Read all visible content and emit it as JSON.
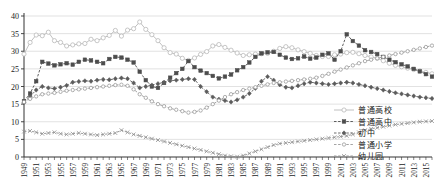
{
  "chart_data": {
    "type": "line",
    "title": "",
    "subtitle": "",
    "xlabel": "",
    "ylabel": "",
    "xlim": [
      1949,
      2016
    ],
    "ylim": [
      0,
      40
    ],
    "yticks": [
      0,
      5,
      10,
      15,
      20,
      25,
      30,
      35,
      40
    ],
    "ytick_labels": [
      "0",
      "5",
      "10",
      "15",
      "20",
      "25",
      "30",
      "35",
      "40"
    ],
    "grid": true,
    "grid_axis": "y",
    "legend_position": "bottom-right",
    "xtick_labels": [
      "1949",
      "1951",
      "1953",
      "1955",
      "1957",
      "1959",
      "1961",
      "1963",
      "1965",
      "1967",
      "1969",
      "1971",
      "1973",
      "1975",
      "1977",
      "1979",
      "1981",
      "1983",
      "1985",
      "1987",
      "1989",
      "1991",
      "1993",
      "1995",
      "1997",
      "1999",
      "2001",
      "2003",
      "2005",
      "2007",
      "2009",
      "2011",
      "2013",
      "2015"
    ],
    "x": [
      1949,
      1950,
      1951,
      1952,
      1953,
      1954,
      1955,
      1956,
      1957,
      1958,
      1959,
      1960,
      1961,
      1962,
      1963,
      1964,
      1965,
      1966,
      1967,
      1968,
      1969,
      1970,
      1971,
      1972,
      1973,
      1974,
      1975,
      1976,
      1977,
      1978,
      1979,
      1980,
      1981,
      1982,
      1983,
      1984,
      1985,
      1986,
      1987,
      1988,
      1989,
      1990,
      1991,
      1992,
      1993,
      1994,
      1995,
      1996,
      1997,
      1998,
      1999,
      2000,
      2001,
      2002,
      2003,
      2004,
      2005,
      2006,
      2007,
      2008,
      2009,
      2010,
      2011,
      2012,
      2013,
      2014,
      2015,
      2016
    ],
    "series": [
      {
        "name": "普通高校",
        "marker": "circle-open",
        "linestyle": "solid",
        "color": "#b9b9b9",
        "values": [
          29.2,
          32.5,
          34.6,
          34.4,
          35.4,
          33.0,
          32.5,
          31.5,
          31.8,
          32.1,
          32.2,
          33.4,
          33.0,
          33.8,
          34.5,
          35.9,
          34.3,
          36.0,
          36.4,
          38.3,
          36.2,
          34.7,
          33.0,
          31.0,
          29.6,
          29.2,
          28.0,
          27.4,
          28.1,
          29.1,
          29.9,
          31.5,
          31.9,
          31.1,
          30.3,
          29.5,
          28.8,
          29.0,
          29.2,
          29.3,
          29.4,
          30.0,
          30.8,
          31.3,
          31.0,
          30.4,
          29.9,
          29.4,
          28.8,
          28.5,
          28.5,
          29.0,
          29.2,
          29.6,
          29.7,
          29.3,
          28.8,
          28.4,
          28.0,
          27.3,
          26.6,
          26.0,
          25.6,
          25.2,
          24.8,
          24.4,
          24.0,
          23.6
        ]
      },
      {
        "name": "普通高中",
        "marker": "square-filled",
        "linestyle": "dashed",
        "color": "#4d4d4d",
        "values": [
          15.8,
          18.0,
          21.5,
          27.0,
          26.5,
          26.0,
          26.3,
          26.6,
          26.2,
          27.0,
          27.6,
          27.4,
          27.0,
          26.6,
          27.8,
          28.4,
          28.2,
          27.6,
          26.8,
          24.2,
          21.8,
          20.0,
          19.6,
          21.0,
          22.5,
          23.8,
          25.0,
          27.2,
          25.5,
          24.5,
          23.8,
          23.0,
          22.3,
          22.8,
          23.4,
          24.6,
          25.5,
          26.8,
          28.4,
          29.4,
          29.7,
          29.8,
          29.0,
          28.2,
          27.8,
          28.0,
          28.5,
          27.9,
          28.2,
          29.0,
          29.4,
          27.6,
          30.0,
          34.8,
          32.9,
          31.6,
          30.3,
          29.8,
          29.2,
          28.4,
          27.6,
          26.9,
          26.3,
          25.7,
          25.0,
          24.3,
          23.5,
          22.8
        ]
      },
      {
        "name": "初中",
        "marker": "diamond-filled",
        "linestyle": "dashed",
        "color": "#5c5c5c",
        "values": [
          15.5,
          17.2,
          19.0,
          20.0,
          19.6,
          19.4,
          19.8,
          20.3,
          21.2,
          21.4,
          21.6,
          21.5,
          21.8,
          22.0,
          21.9,
          22.2,
          22.4,
          22.2,
          21.0,
          19.6,
          20.0,
          20.4,
          20.8,
          21.2,
          21.6,
          21.8,
          22.0,
          22.2,
          22.0,
          20.0,
          18.5,
          17.0,
          16.4,
          16.0,
          15.6,
          16.2,
          17.0,
          18.0,
          19.5,
          21.5,
          22.8,
          21.8,
          20.5,
          19.8,
          19.6,
          20.2,
          20.8,
          21.2,
          21.0,
          20.8,
          20.6,
          20.8,
          21.0,
          21.2,
          21.0,
          20.6,
          20.2,
          19.8,
          19.4,
          19.0,
          18.6,
          18.2,
          17.9,
          17.6,
          17.3,
          17.0,
          16.8,
          16.6
        ]
      },
      {
        "name": "普通小学",
        "marker": "circle-open-small",
        "linestyle": "dashed",
        "color": "#9a9a9a",
        "values": [
          15.6,
          16.5,
          17.2,
          17.8,
          18.0,
          18.2,
          18.5,
          18.8,
          19.0,
          19.2,
          19.4,
          19.6,
          19.8,
          20.0,
          20.2,
          20.4,
          20.5,
          20.2,
          19.2,
          17.8,
          16.8,
          15.8,
          15.0,
          14.4,
          13.8,
          13.4,
          13.0,
          12.6,
          12.8,
          13.2,
          14.0,
          15.0,
          16.0,
          17.0,
          17.8,
          18.4,
          19.0,
          19.4,
          19.8,
          20.2,
          20.6,
          21.0,
          21.2,
          21.4,
          21.6,
          21.8,
          22.0,
          22.2,
          22.5,
          23.0,
          23.6,
          24.2,
          24.8,
          25.4,
          26.0,
          26.6,
          27.2,
          27.6,
          28.0,
          28.4,
          28.8,
          29.2,
          29.6,
          30.0,
          30.4,
          30.8,
          31.2,
          31.6
        ]
      },
      {
        "name": "幼儿园",
        "marker": "x-mark",
        "linestyle": "dashed",
        "color": "#8f8f8f",
        "values": [
          7.2,
          7.4,
          7.0,
          6.6,
          6.8,
          7.0,
          6.6,
          6.4,
          6.6,
          6.8,
          6.6,
          6.4,
          6.2,
          6.4,
          6.6,
          6.8,
          7.6,
          7.0,
          6.4,
          6.0,
          5.6,
          5.2,
          4.8,
          4.4,
          4.0,
          3.6,
          3.2,
          2.8,
          2.4,
          2.0,
          1.6,
          1.2,
          0.8,
          0.4,
          0.2,
          0.1,
          0.4,
          1.0,
          1.6,
          2.2,
          2.8,
          3.4,
          3.8,
          4.0,
          4.2,
          4.4,
          4.6,
          4.8,
          5.0,
          5.2,
          5.4,
          5.6,
          5.8,
          6.0,
          6.4,
          7.0,
          7.6,
          8.0,
          8.3,
          8.6,
          8.9,
          9.2,
          9.4,
          9.6,
          9.8,
          10.0,
          10.1,
          10.2
        ]
      }
    ]
  }
}
